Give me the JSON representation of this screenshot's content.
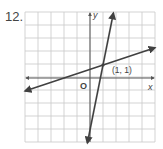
{
  "problem": {
    "number": "12."
  },
  "chart_data": {
    "type": "line",
    "title": "",
    "xlabel": "x",
    "ylabel": "y",
    "origin_label": "O",
    "xlim": [
      -5,
      5
    ],
    "ylim": [
      -5,
      5
    ],
    "grid": true,
    "grid_step": 1,
    "series": [
      {
        "name": "shallow line",
        "equation": "y = (1/3)x + 2/3",
        "x": [
          -5,
          5
        ],
        "y": [
          -1,
          2.333
        ],
        "arrows": "both"
      },
      {
        "name": "steep line",
        "equation": "y = 5x - 4",
        "x": [
          -0.2,
          1.8
        ],
        "y": [
          -5,
          5
        ],
        "arrows": "both"
      }
    ],
    "annotations": [
      {
        "text": "(1, 1)",
        "x": 1,
        "y": 1,
        "type": "intersection-point"
      }
    ]
  },
  "colors": {
    "grid": "#c8c8c8",
    "axis": "#555555",
    "line": "#404040",
    "text": "#444444"
  }
}
